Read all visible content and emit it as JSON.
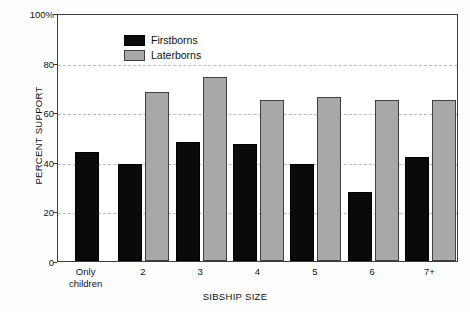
{
  "chart_data": {
    "type": "bar",
    "title": "",
    "subtitle": "",
    "xlabel": "SIBSHIP SIZE",
    "ylabel": "PERCENT SUPPORT",
    "categories": [
      "Only children",
      "2",
      "3",
      "4",
      "5",
      "6",
      "7+"
    ],
    "series": [
      {
        "name": "Firstborns",
        "color": "#0a0a0a",
        "values": [
          44,
          39,
          48,
          47,
          39,
          28,
          42
        ]
      },
      {
        "name": "Laterborns",
        "color": "#a8a8a8",
        "values": [
          null,
          68,
          74,
          65,
          66,
          65,
          65
        ]
      }
    ],
    "ylim": [
      0,
      100
    ],
    "yticks": [
      0,
      20,
      40,
      60,
      80,
      100
    ],
    "ytick_labels": [
      "0",
      "20",
      "40",
      "60",
      "80",
      "100%"
    ],
    "gridlines": [
      20,
      40,
      60,
      80
    ],
    "grid": true,
    "grid_style": "dashed",
    "grid_color": "#b9b9b9",
    "legend_position": "top-left-inside"
  },
  "legend": {
    "entries": [
      {
        "label": "Firstborns",
        "swatch": "firstborns"
      },
      {
        "label": "Laterborns",
        "swatch": "laterborns"
      }
    ]
  }
}
